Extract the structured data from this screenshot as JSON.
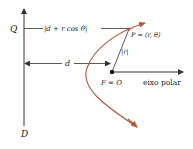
{
  "diagram": {
    "labels": {
      "Q": "Q",
      "D": "D",
      "distance_PD": "|d + r cos θ|",
      "d": "d",
      "point_P": "P = (r, θ)",
      "r": "|r|",
      "focus": "F = O",
      "polar_axis": "eixo polar"
    },
    "colors": {
      "lines": "#333333",
      "curve": "#b0573a",
      "background": "#ffffff"
    }
  }
}
